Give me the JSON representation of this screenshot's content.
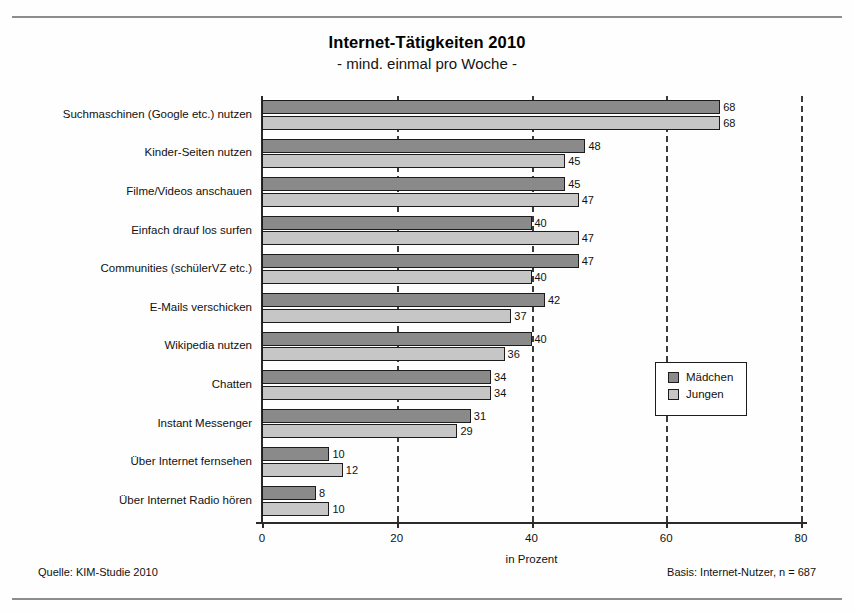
{
  "chart_data": {
    "type": "bar",
    "orientation": "horizontal",
    "title": "Internet-Tätigkeiten 2010",
    "subtitle": "- mind. einmal pro Woche -",
    "xlabel": "in Prozent",
    "ylabel": "",
    "xlim": [
      0,
      80
    ],
    "xticks": [
      0,
      20,
      40,
      60,
      80
    ],
    "xtick_labels": [
      "0",
      "20",
      "40",
      "60",
      "80"
    ],
    "grid": "vertical-dashed",
    "legend_position": "middle-right",
    "categories": [
      "Suchmaschinen (Google etc.) nutzen",
      "Kinder-Seiten nutzen",
      "Filme/Videos anschauen",
      "Einfach drauf los surfen",
      "Communities (schülerVZ etc.)",
      "E-Mails verschicken",
      "Wikipedia nutzen",
      "Chatten",
      "Instant Messenger",
      "Über Internet fernsehen",
      "Über Internet Radio hören"
    ],
    "series": [
      {
        "name": "Mädchen",
        "color": "#8a8a8a",
        "values": [
          68,
          48,
          45,
          40,
          47,
          42,
          40,
          34,
          31,
          10,
          8
        ]
      },
      {
        "name": "Jungen",
        "color": "#c6c6c6",
        "values": [
          68,
          45,
          47,
          47,
          40,
          37,
          36,
          34,
          29,
          12,
          10
        ]
      }
    ]
  },
  "footer": {
    "source": "Quelle: KIM-Studie 2010",
    "basis": "Basis: Internet-Nutzer, n = 687"
  }
}
